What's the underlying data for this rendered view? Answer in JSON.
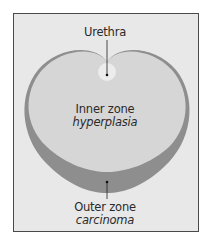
{
  "diagram": {
    "labels": {
      "urethra": "Urethra",
      "inner_zone": "Inner zone",
      "inner_zone_condition": "hyperplasia",
      "outer_zone": "Outer zone",
      "outer_zone_condition": "carcinoma"
    },
    "colors": {
      "background": "#e8e8e8",
      "border": "#4a4a4a",
      "inner_zone": "#d6d6d6",
      "outer_zone": "#8e8e8e",
      "urethra": "#ececec",
      "leader_line": "#222222",
      "text": "#2a2a2a"
    }
  }
}
